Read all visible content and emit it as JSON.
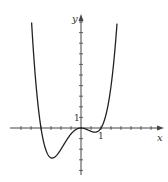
{
  "chart_data": {
    "type": "line",
    "title": "",
    "xlabel": "x",
    "ylabel": "y",
    "function_estimate": "y = x^2 (x + 2)(x - 1)",
    "x_tick_labels": [
      {
        "value": 1,
        "label": "1"
      }
    ],
    "y_tick_labels": [
      {
        "value": 1,
        "label": "1"
      }
    ],
    "x_tick_step": 0.5,
    "y_tick_step": 1,
    "xlim": [
      -3,
      4.1
    ],
    "ylim": [
      -4.2,
      10.6
    ],
    "key_points": [
      {
        "name": "left-root",
        "x": -2,
        "y": 0
      },
      {
        "name": "global-min",
        "x": -1.44,
        "y": -2.83
      },
      {
        "name": "local-max",
        "x": 0,
        "y": 0
      },
      {
        "name": "local-min",
        "x": 0.69,
        "y": -0.4
      },
      {
        "name": "right-root",
        "x": 1,
        "y": 0
      }
    ],
    "grid": false,
    "legend": null
  },
  "axes": {
    "x_label": "x",
    "y_label": "y",
    "x_one_label": "1",
    "y_one_label": "1"
  },
  "colors": {
    "curve": "#222222",
    "axis": "#444444"
  }
}
